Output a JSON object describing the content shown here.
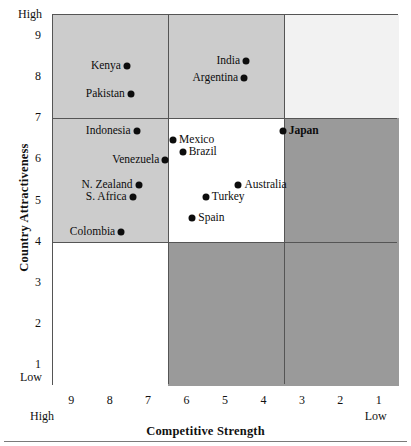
{
  "chart_data": {
    "type": "scatter",
    "title": "",
    "xlabel": "Competitive Strength",
    "ylabel": "Country Attractiveness",
    "xlim": [
      9.5,
      0.5
    ],
    "ylim": [
      0.5,
      9.5
    ],
    "x_axis_reversed": true,
    "grid": false,
    "legend": "none",
    "x_ticks": [
      "9",
      "8",
      "7",
      "6",
      "5",
      "4",
      "3",
      "2",
      "1"
    ],
    "x_tick_values": [
      9,
      8,
      7,
      6,
      5,
      4,
      3,
      2,
      1
    ],
    "y_ticks": [
      "9",
      "8",
      "7",
      "6",
      "5",
      "4",
      "3",
      "2",
      "1"
    ],
    "y_tick_values": [
      9,
      8,
      7,
      6,
      5,
      4,
      3,
      2,
      1
    ],
    "x_endcap_low": "Low",
    "x_endcap_high": "High",
    "y_endcap_low": "Low",
    "y_endcap_high": "High",
    "x_dividers": [
      6.5,
      3.5
    ],
    "y_dividers": [
      7,
      4
    ],
    "cell_shades": [
      [
        "#cccccc",
        "#cccccc",
        "#f2f2f2"
      ],
      [
        "#cccccc",
        "#ffffff",
        "#9a9a9a"
      ],
      [
        "#ffffff",
        "#9a9a9a",
        "#9a9a9a"
      ]
    ],
    "points": [
      {
        "label": "Kenya",
        "x": 7.55,
        "y": 8.25,
        "label_side": "left",
        "bold": false
      },
      {
        "label": "Pakistan",
        "x": 7.45,
        "y": 7.55,
        "label_side": "left",
        "bold": false
      },
      {
        "label": "Indonesia",
        "x": 7.3,
        "y": 6.65,
        "label_side": "left",
        "bold": false
      },
      {
        "label": "Venezuela",
        "x": 6.55,
        "y": 5.95,
        "label_side": "left",
        "bold": false
      },
      {
        "label": "N. Zealand",
        "x": 7.25,
        "y": 5.35,
        "label_side": "left",
        "bold": false
      },
      {
        "label": "S. Africa",
        "x": 7.4,
        "y": 5.05,
        "label_side": "left",
        "bold": false
      },
      {
        "label": "Colombia",
        "x": 7.7,
        "y": 4.2,
        "label_side": "left",
        "bold": false
      },
      {
        "label": "India",
        "x": 4.45,
        "y": 8.35,
        "label_side": "left",
        "bold": false
      },
      {
        "label": "Argentina",
        "x": 4.5,
        "y": 7.95,
        "label_side": "left",
        "bold": false
      },
      {
        "label": "Japan",
        "x": 3.5,
        "y": 6.65,
        "label_side": "right",
        "bold": true
      },
      {
        "label": "Mexico",
        "x": 6.35,
        "y": 6.45,
        "label_side": "right",
        "bold": false
      },
      {
        "label": "Brazil",
        "x": 6.1,
        "y": 6.15,
        "label_side": "right",
        "bold": false
      },
      {
        "label": "Australia",
        "x": 4.65,
        "y": 5.35,
        "label_side": "right",
        "bold": false
      },
      {
        "label": "Turkey",
        "x": 5.5,
        "y": 5.05,
        "label_side": "right",
        "bold": false
      },
      {
        "label": "Spain",
        "x": 5.85,
        "y": 4.55,
        "label_side": "right",
        "bold": false
      }
    ]
  },
  "colors": {
    "shade_light": "#f2f2f2",
    "shade_medium": "#cccccc",
    "shade_dark": "#9a9a9a",
    "shade_white": "#ffffff",
    "line": "#555555",
    "point": "#0d0d0d",
    "text": "#111111"
  }
}
